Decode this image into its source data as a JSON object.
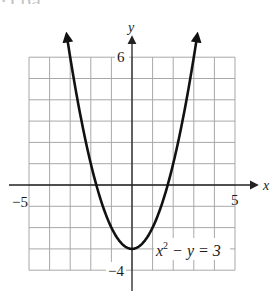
{
  "page": {
    "clipped_header_text": "·) pa"
  },
  "chart_data": {
    "type": "line",
    "title": "",
    "equation_label": {
      "base": "x",
      "exp": "2",
      "rest": " − y = 3"
    },
    "xlabel": "x",
    "ylabel": "y",
    "xlim": [
      -5,
      5
    ],
    "ylim": [
      -4,
      6
    ],
    "grid": true,
    "grid_step": 1,
    "tick_labels": {
      "x_min": "−5",
      "x_max": "5",
      "y_max": "6",
      "y_min": "−4"
    },
    "series": [
      {
        "name": "x^2 - y = 3",
        "function": "y = x^2 - 3",
        "x": [
          -3.17,
          -3,
          -2,
          -1,
          0,
          1,
          2,
          3,
          3.17
        ],
        "y": [
          7.05,
          6,
          1,
          -2,
          -3,
          -2,
          1,
          6,
          7.05
        ],
        "vertex": [
          0,
          -3
        ],
        "arrows_at_ends": true
      }
    ]
  },
  "colors": {
    "grid": "#a8a8a8",
    "axis": "#222222",
    "curve": "#111111",
    "background": "#ffffff"
  },
  "layout": {
    "x0_px": 132,
    "y0_px": 185,
    "x_scale": 20.6,
    "y_scale": 21.3,
    "axis_x_start": 9,
    "axis_x_end": 257,
    "axis_y_top": 37,
    "axis_y_bottom": 291
  }
}
